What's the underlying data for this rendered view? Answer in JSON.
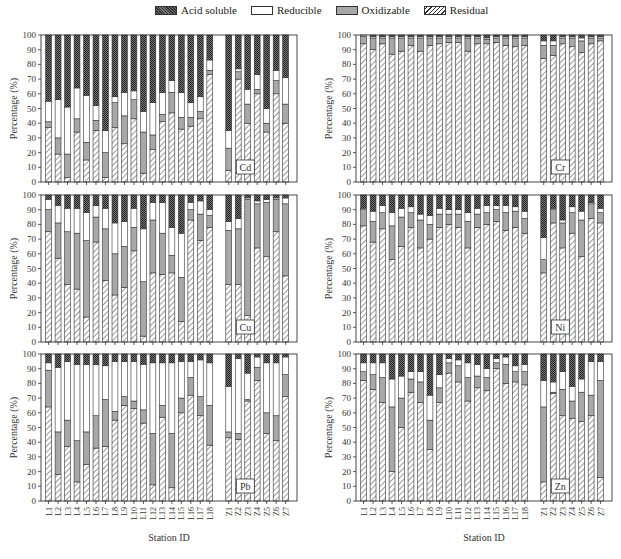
{
  "legend": {
    "acid_soluble": "Acid soluble",
    "reducible": "Reducible",
    "oxidizable": "Oxidizable",
    "residual": "Residual"
  },
  "colors": {
    "acid_soluble": "#555555",
    "reducible": "#ffffff",
    "oxidizable": "#a8a8a8",
    "residual": "#ffffff",
    "axis": "#333333"
  },
  "chart_data": [
    {
      "type": "bar",
      "stacked": true,
      "title": "Cd",
      "xlabel": "Station ID",
      "ylabel": "Percentage (%)",
      "ylim": [
        0,
        100
      ],
      "yticks": [
        0,
        10,
        20,
        30,
        40,
        50,
        60,
        70,
        80,
        90,
        100
      ],
      "categories": [
        "L1",
        "L2",
        "L3",
        "L4",
        "L5",
        "L6",
        "L7",
        "L8",
        "L9",
        "L10",
        "L11",
        "L12",
        "L13",
        "L14",
        "L15",
        "L16",
        "L17",
        "L18",
        "Z1",
        "Z2",
        "Z3",
        "Z4",
        "Z5",
        "Z6",
        "Z7"
      ],
      "series": [
        {
          "name": "Residual",
          "values": [
            37,
            19,
            3,
            34,
            15,
            35,
            3,
            37,
            26,
            43,
            6,
            22,
            41,
            47,
            36,
            38,
            43,
            73,
            8,
            70,
            40,
            60,
            34,
            60,
            40
          ]
        },
        {
          "name": "Oxidizable",
          "values": [
            4,
            11,
            16,
            9,
            12,
            7,
            17,
            17,
            19,
            13,
            28,
            10,
            5,
            14,
            8,
            6,
            5,
            3,
            15,
            5,
            13,
            3,
            6,
            9,
            13
          ]
        },
        {
          "name": "Reducible",
          "values": [
            14,
            26,
            32,
            21,
            32,
            10,
            15,
            4,
            16,
            6,
            14,
            22,
            15,
            8,
            17,
            10,
            10,
            7,
            12,
            2,
            10,
            10,
            10,
            7,
            18
          ]
        },
        {
          "name": "Acid soluble",
          "values": [
            45,
            44,
            49,
            36,
            41,
            48,
            65,
            42,
            39,
            38,
            52,
            46,
            39,
            31,
            39,
            46,
            42,
            17,
            65,
            23,
            37,
            27,
            50,
            24,
            29
          ]
        }
      ]
    },
    {
      "type": "bar",
      "stacked": true,
      "title": "Cr",
      "xlabel": "Station ID",
      "ylabel": "Percentage (%)",
      "ylim": [
        0,
        100
      ],
      "yticks": [
        0,
        10,
        20,
        30,
        40,
        50,
        60,
        70,
        80,
        90,
        100
      ],
      "categories": [
        "L1",
        "L2",
        "L3",
        "L4",
        "L5",
        "L6",
        "L7",
        "L8",
        "L9",
        "L10",
        "L11",
        "L12",
        "L13",
        "L14",
        "L15",
        "L16",
        "L17",
        "L18",
        "Z1",
        "Z2",
        "Z3",
        "Z4",
        "Z5",
        "Z6",
        "Z7"
      ],
      "series": [
        {
          "name": "Residual",
          "values": [
            94,
            90,
            94,
            87,
            89,
            93,
            89,
            93,
            94,
            95,
            95,
            89,
            94,
            94,
            95,
            93,
            92,
            93,
            84,
            86,
            94,
            92,
            88,
            94,
            96
          ]
        },
        {
          "name": "Oxidizable",
          "values": [
            5,
            8,
            4,
            11,
            9,
            5,
            9,
            5,
            4,
            3,
            3,
            9,
            4,
            3,
            3,
            5,
            6,
            5,
            9,
            7,
            4,
            6,
            8,
            4,
            2
          ]
        },
        {
          "name": "Reducible",
          "values": [
            1,
            1,
            1,
            1,
            1,
            1,
            1,
            1,
            1,
            1,
            1,
            1,
            1,
            1,
            1,
            1,
            1,
            1,
            3,
            3,
            1,
            1,
            2,
            1,
            1
          ]
        },
        {
          "name": "Acid soluble",
          "values": [
            0,
            1,
            1,
            1,
            1,
            1,
            1,
            1,
            1,
            1,
            1,
            1,
            1,
            2,
            1,
            1,
            1,
            1,
            4,
            4,
            1,
            1,
            2,
            1,
            1
          ]
        }
      ]
    },
    {
      "type": "bar",
      "stacked": true,
      "title": "Cu",
      "xlabel": "Station ID",
      "ylabel": "Percentage (%)",
      "ylim": [
        0,
        100
      ],
      "yticks": [
        0,
        10,
        20,
        30,
        40,
        50,
        60,
        70,
        80,
        90,
        100
      ],
      "categories": [
        "L1",
        "L2",
        "L3",
        "L4",
        "L5",
        "L6",
        "L7",
        "L8",
        "L9",
        "L10",
        "L11",
        "L12",
        "L13",
        "L14",
        "L15",
        "L16",
        "L17",
        "L18",
        "Z1",
        "Z2",
        "Z3",
        "Z4",
        "Z5",
        "Z6",
        "Z7"
      ],
      "series": [
        {
          "name": "Residual",
          "values": [
            75,
            57,
            39,
            36,
            17,
            68,
            42,
            32,
            37,
            62,
            4,
            47,
            46,
            47,
            14,
            83,
            69,
            78,
            39,
            39,
            18,
            64,
            58,
            75,
            45
          ]
        },
        {
          "name": "Oxidizable",
          "values": [
            15,
            24,
            36,
            38,
            52,
            17,
            35,
            28,
            28,
            16,
            37,
            36,
            28,
            12,
            30,
            7,
            18,
            8,
            37,
            38,
            79,
            30,
            37,
            22,
            49
          ]
        },
        {
          "name": "Reducible",
          "values": [
            7,
            12,
            16,
            17,
            19,
            8,
            14,
            21,
            17,
            13,
            36,
            12,
            21,
            19,
            30,
            5,
            9,
            4,
            6,
            7,
            1,
            2,
            2,
            1,
            4
          ]
        },
        {
          "name": "Acid soluble",
          "values": [
            3,
            7,
            9,
            9,
            12,
            7,
            9,
            19,
            18,
            9,
            23,
            5,
            5,
            22,
            26,
            5,
            4,
            10,
            18,
            16,
            2,
            4,
            3,
            2,
            2
          ]
        }
      ]
    },
    {
      "type": "bar",
      "stacked": true,
      "title": "Ni",
      "xlabel": "Station ID",
      "ylabel": "Percentage (%)",
      "ylim": [
        0,
        100
      ],
      "yticks": [
        0,
        10,
        20,
        30,
        40,
        50,
        60,
        70,
        80,
        90,
        100
      ],
      "categories": [
        "L1",
        "L2",
        "L3",
        "L4",
        "L5",
        "L6",
        "L7",
        "L8",
        "L9",
        "L10",
        "L11",
        "L12",
        "L13",
        "L14",
        "L15",
        "L16",
        "L17",
        "L18",
        "Z1",
        "Z2",
        "Z3",
        "Z4",
        "Z5",
        "Z6",
        "Z7"
      ],
      "series": [
        {
          "name": "Residual",
          "values": [
            79,
            68,
            77,
            56,
            65,
            78,
            64,
            70,
            78,
            80,
            78,
            64,
            78,
            80,
            82,
            76,
            78,
            74,
            47,
            81,
            64,
            74,
            58,
            84,
            81
          ]
        },
        {
          "name": "Oxidizable",
          "values": [
            11,
            14,
            11,
            23,
            20,
            10,
            19,
            10,
            9,
            7,
            9,
            18,
            9,
            8,
            8,
            12,
            11,
            10,
            9,
            9,
            17,
            14,
            25,
            10,
            7
          ]
        },
        {
          "name": "Reducible",
          "values": [
            1,
            7,
            5,
            9,
            6,
            4,
            4,
            6,
            4,
            3,
            3,
            6,
            4,
            5,
            3,
            5,
            3,
            5,
            15,
            1,
            2,
            4,
            6,
            1,
            3
          ]
        },
        {
          "name": "Acid soluble",
          "values": [
            9,
            11,
            7,
            12,
            9,
            8,
            13,
            14,
            9,
            10,
            10,
            12,
            9,
            7,
            7,
            7,
            8,
            11,
            29,
            9,
            17,
            8,
            11,
            5,
            9
          ]
        }
      ]
    },
    {
      "type": "bar",
      "stacked": true,
      "title": "Pb",
      "xlabel": "Station ID",
      "ylabel": "Percentage (%)",
      "ylim": [
        0,
        100
      ],
      "yticks": [
        0,
        10,
        20,
        30,
        40,
        50,
        60,
        70,
        80,
        90,
        100
      ],
      "categories": [
        "L1",
        "L2",
        "L3",
        "L4",
        "L5",
        "L6",
        "L7",
        "L8",
        "L9",
        "L10",
        "L11",
        "L12",
        "L13",
        "L14",
        "L15",
        "L16",
        "L17",
        "L18",
        "Z1",
        "Z2",
        "Z3",
        "Z4",
        "Z5",
        "Z6",
        "Z7"
      ],
      "series": [
        {
          "name": "Residual",
          "values": [
            64,
            18,
            37,
            13,
            25,
            36,
            37,
            55,
            65,
            63,
            53,
            11,
            57,
            9,
            60,
            72,
            58,
            38,
            43,
            42,
            68,
            82,
            46,
            41,
            71
          ]
        },
        {
          "name": "Oxidizable",
          "values": [
            25,
            29,
            18,
            28,
            22,
            22,
            32,
            6,
            6,
            5,
            9,
            35,
            8,
            37,
            10,
            12,
            13,
            27,
            4,
            4,
            1,
            9,
            14,
            17,
            15
          ]
        },
        {
          "name": "Reducible",
          "values": [
            5,
            44,
            40,
            52,
            46,
            35,
            23,
            34,
            24,
            27,
            31,
            48,
            29,
            48,
            25,
            11,
            25,
            29,
            31,
            51,
            18,
            7,
            34,
            36,
            12
          ]
        },
        {
          "name": "Acid soluble",
          "values": [
            6,
            9,
            5,
            7,
            7,
            7,
            8,
            5,
            5,
            5,
            7,
            6,
            6,
            6,
            5,
            5,
            4,
            6,
            22,
            3,
            13,
            2,
            6,
            6,
            2
          ]
        }
      ]
    },
    {
      "type": "bar",
      "stacked": true,
      "title": "Zn",
      "xlabel": "Station ID",
      "ylabel": "Percentage (%)",
      "ylim": [
        0,
        100
      ],
      "yticks": [
        0,
        10,
        20,
        30,
        40,
        50,
        60,
        70,
        80,
        90,
        100
      ],
      "categories": [
        "L1",
        "L2",
        "L3",
        "L4",
        "L5",
        "L6",
        "L7",
        "L8",
        "L9",
        "L10",
        "L11",
        "L12",
        "L13",
        "L14",
        "L15",
        "L16",
        "L17",
        "L18",
        "Z1",
        "Z2",
        "Z3",
        "Z4",
        "Z5",
        "Z6",
        "Z7"
      ],
      "series": [
        {
          "name": "Residual",
          "values": [
            82,
            76,
            67,
            20,
            50,
            74,
            67,
            35,
            67,
            87,
            81,
            68,
            77,
            75,
            90,
            80,
            81,
            79,
            13,
            73,
            58,
            56,
            54,
            58,
            16
          ]
        },
        {
          "name": "Oxidizable",
          "values": [
            6,
            10,
            17,
            44,
            20,
            9,
            14,
            20,
            10,
            7,
            11,
            16,
            8,
            9,
            4,
            13,
            7,
            9,
            51,
            1,
            18,
            12,
            20,
            14,
            66
          ]
        },
        {
          "name": "Reducible",
          "values": [
            6,
            8,
            10,
            19,
            15,
            5,
            7,
            17,
            9,
            3,
            4,
            10,
            8,
            6,
            3,
            5,
            4,
            5,
            18,
            7,
            12,
            10,
            9,
            23,
            13
          ]
        },
        {
          "name": "Acid soluble",
          "values": [
            6,
            6,
            6,
            17,
            15,
            12,
            12,
            28,
            14,
            3,
            4,
            6,
            7,
            10,
            3,
            2,
            8,
            7,
            18,
            19,
            12,
            22,
            17,
            5,
            5
          ]
        }
      ]
    }
  ]
}
